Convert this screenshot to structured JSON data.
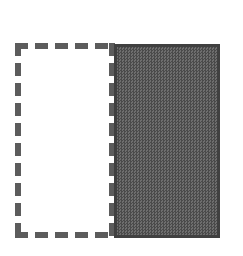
{
  "figure": {
    "canvas": {
      "width": 243,
      "height": 256,
      "background_color": "#ffffff"
    },
    "shapes": [
      {
        "name": "dashed-outline-rectangle",
        "style": "dashed",
        "fill": "none",
        "fill_color": "#ffffff",
        "stroke_color": "#5c5c5c",
        "stroke_width": 6,
        "dash_length": 13,
        "gap_length": 7,
        "x": 15,
        "y": 43,
        "width": 100,
        "height": 195
      },
      {
        "name": "filled-gray-rectangle",
        "style": "solid",
        "fill": "dither-checkerboard",
        "fill_color": "#5f5f5f",
        "fill_color_dark": "#4a4a4a",
        "fill_color_light": "#6e6e6e",
        "stroke_color": "#404040",
        "stroke_width": 3,
        "x": 114,
        "y": 44,
        "width": 106,
        "height": 194
      }
    ]
  }
}
